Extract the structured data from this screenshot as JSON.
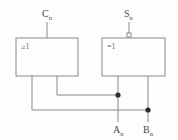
{
  "diagram": {
    "stroke_color": "#8a8a8a",
    "label_color": "#4a4a4a",
    "background": "#fdfdfd",
    "gates": [
      {
        "id": "or-gate",
        "symbol": "≥1",
        "name": "or-gate",
        "x": 16,
        "y": 38,
        "width": 62,
        "height": 38
      },
      {
        "id": "xor-gate",
        "symbol": "=1",
        "name": "xor-gate",
        "x": 102,
        "y": 38,
        "width": 63,
        "height": 38
      }
    ],
    "signals": {
      "carry_out": {
        "base": "C",
        "subscript": "n",
        "x": 47,
        "y": 14
      },
      "sum": {
        "base": "S",
        "subscript": "n",
        "x": 129,
        "y": 14
      },
      "input_a": {
        "base": "A",
        "subscript": "n",
        "x": 114,
        "y": 132
      },
      "input_b": {
        "base": "B",
        "subscript": "n",
        "x": 145,
        "y": 132
      }
    },
    "junctions": [
      {
        "name": "junction-a",
        "x": 118,
        "y": 95
      },
      {
        "name": "junction-b",
        "x": 148,
        "y": 110
      }
    ],
    "inversion_bubble": {
      "name": "inversion-bubble",
      "x": 129,
      "y": 35,
      "size": 4
    }
  }
}
